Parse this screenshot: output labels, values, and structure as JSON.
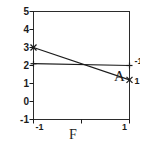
{
  "chart_data": {
    "type": "line",
    "title": "",
    "subtitle": "",
    "xlabel": "F",
    "ylabel": "",
    "x": [
      -1,
      1
    ],
    "xticklabels": [
      "-1",
      "1"
    ],
    "xlim": [
      -1,
      1
    ],
    "yticklabels": [
      "-1",
      "0",
      "1",
      "2",
      "3",
      "4",
      "5"
    ],
    "yticks": [
      -1,
      0,
      1,
      2,
      3,
      4,
      5
    ],
    "ylim": [
      -1,
      5
    ],
    "grid": false,
    "legend_position": "inline-right",
    "series_variable": "A",
    "series": [
      {
        "name": "-1",
        "marker": "plus",
        "values": [
          2.1,
          2.0
        ]
      },
      {
        "name": "1",
        "marker": "cross",
        "values": [
          3.0,
          1.2
        ]
      }
    ],
    "annotations": [
      "-1",
      "1",
      "A"
    ],
    "line_color": "#1b1b1b",
    "frame_color": "#2b2b2b",
    "background_color": "#ffffff"
  }
}
